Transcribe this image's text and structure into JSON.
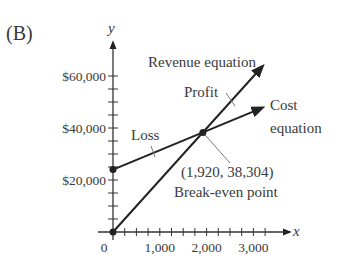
{
  "panel_label": "(B)",
  "chart_data": {
    "type": "line",
    "title": "",
    "xlabel": "x",
    "ylabel": "y",
    "xlim": [
      0,
      3300
    ],
    "ylim": [
      0,
      68000
    ],
    "x_ticks": [
      0,
      1000,
      2000,
      3000
    ],
    "x_tick_labels": [
      "0",
      "1,000",
      "2,000",
      "3,000"
    ],
    "x_minor_tick_step": 250,
    "y_ticks": [
      20000,
      40000,
      60000
    ],
    "y_tick_labels": [
      "$20,000",
      "$40,000",
      "$60,000"
    ],
    "y_minor_tick_step": 5000,
    "grid": false,
    "series": [
      {
        "name": "Revenue equation",
        "points": [
          [
            0,
            0
          ],
          [
            1920,
            38304
          ],
          [
            3200,
            63840
          ]
        ]
      },
      {
        "name": "Cost equation",
        "points": [
          [
            0,
            24000
          ],
          [
            1920,
            38304
          ],
          [
            3200,
            47840
          ]
        ]
      }
    ],
    "annotations": [
      {
        "text": "Revenue equation",
        "role": "series-label"
      },
      {
        "text": "Cost",
        "role": "series-label"
      },
      {
        "text": "equation",
        "role": "series-label"
      },
      {
        "text": "Profit",
        "role": "region-label"
      },
      {
        "text": "Loss",
        "role": "region-label"
      },
      {
        "text": "(1,920, 38,304)",
        "role": "point-label"
      },
      {
        "text": "Break-even point",
        "role": "point-label"
      }
    ],
    "break_even": {
      "x": 1920,
      "y": 38304,
      "label": "Break-even point",
      "coord_label": "(1,920, 38,304)"
    }
  },
  "colors": {
    "line": "#222222",
    "axis": "#333333",
    "text": "#3a3a3a",
    "leader": "#777777"
  }
}
